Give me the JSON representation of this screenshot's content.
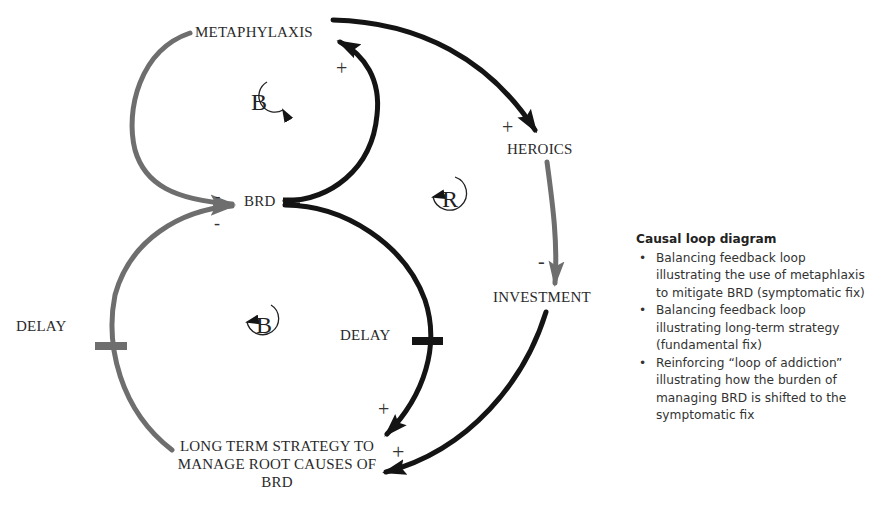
{
  "nodes": {
    "metaphylaxis": "METAPHYLAXIS",
    "heroics": "HEROICS",
    "brd": "BRD",
    "investment": "INVESTMENT",
    "long_term_strategy": "LONG TERM STRATEGY TO MANAGE ROOT CAUSES OF BRD",
    "delay_left": "DELAY",
    "delay_right": "DELAY"
  },
  "loops": {
    "top_balancing": "B",
    "bottom_balancing": "B",
    "reinforcing": "R"
  },
  "polarities": {
    "brd_to_metaphylaxis": "+",
    "metaphylaxis_to_heroics": "+",
    "heroics_to_investment": "-",
    "metaphylaxis_to_brd": "-",
    "strategy_to_brd": "-",
    "brd_to_strategy": "+",
    "investment_to_strategy": "+"
  },
  "colors": {
    "gray_link": "#6e6e6e",
    "black_link": "#141414",
    "text": "#2a2a2a"
  },
  "legend": {
    "title": "Causal loop diagram",
    "items": [
      "Balancing feedback loop illustrating the use of metaphlaxis to mitigate BRD (symptomatic fix)",
      "Balancing feedback loop illustrating long-term strategy (fundamental fix)",
      "Reinforcing “loop of addiction” illustrating how the burden of managing BRD is shifted to the symptomatic fix"
    ]
  }
}
